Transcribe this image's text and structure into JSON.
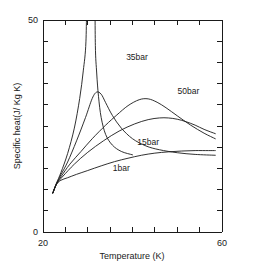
{
  "chart_data": {
    "type": "line",
    "title": "",
    "xlabel": "Temperature (K)",
    "ylabel": "Specific heat(J/ Kg K)",
    "xlim": [
      20,
      60
    ],
    "ylim": [
      0,
      50
    ],
    "xticks": [
      20,
      60
    ],
    "xtick_labels": [
      "20",
      "60"
    ],
    "yticks": [
      0,
      50
    ],
    "ytick_labels": [
      "0",
      "50"
    ],
    "x_minor_tick_count": 8,
    "y_minor_tick_count": 10,
    "grid": false,
    "legend_position": "inline-annotations",
    "series": [
      {
        "name": "1bar",
        "label": "1bar",
        "label_x": 37.5,
        "label_y": 14.5,
        "x": [
          22.2,
          23.0,
          24.0,
          25.5,
          27.5,
          30.0,
          33.0,
          36.0,
          39.0,
          42.0,
          45.0,
          48.0,
          51.0,
          54.0,
          57.0,
          58.5
        ],
        "y": [
          9.2,
          11.2,
          12.2,
          12.8,
          13.6,
          14.5,
          15.6,
          16.6,
          17.4,
          18.1,
          18.6,
          18.9,
          19.1,
          19.2,
          19.2,
          19.2
        ]
      },
      {
        "name": "15bar",
        "label": "15bar",
        "label_x": 43.5,
        "label_y": 20.5,
        "x": [
          22.2,
          23.0,
          24.0,
          25.5,
          27.5,
          29.5,
          31.0,
          32.0,
          33.0,
          34.0,
          35.5,
          37.5,
          40.0,
          43.0,
          46.0,
          50.0,
          54.0,
          58.5
        ],
        "y": [
          9.2,
          11.3,
          13.5,
          16.5,
          21.5,
          27.0,
          31.5,
          33.0,
          32.5,
          30.5,
          27.5,
          24.5,
          22.0,
          20.3,
          19.4,
          18.7,
          18.3,
          18.1
        ]
      },
      {
        "name": "35bar",
        "label": "35bar",
        "label_x": 41.0,
        "label_y": 40.5,
        "x": [
          22.2,
          23.0,
          24.0,
          26.0,
          28.5,
          31.0,
          34.0,
          36.5,
          39.0,
          41.5,
          43.5,
          45.5,
          47.5,
          50.0,
          53.0,
          56.0,
          58.5
        ],
        "y": [
          9.2,
          11.3,
          13.0,
          16.0,
          19.0,
          22.0,
          25.2,
          27.6,
          29.8,
          31.2,
          31.4,
          30.6,
          29.3,
          27.4,
          25.2,
          23.3,
          22.0
        ]
      },
      {
        "name": "50bar",
        "label": "50bar",
        "label_x": 52.5,
        "label_y": 32.5,
        "x": [
          22.2,
          23.0,
          24.5,
          27.0,
          30.0,
          33.5,
          37.0,
          40.5,
          43.5,
          46.0,
          48.0,
          50.0,
          52.0,
          54.0,
          56.0,
          58.5
        ],
        "y": [
          9.2,
          11.3,
          13.2,
          16.0,
          18.8,
          21.5,
          23.8,
          25.5,
          26.5,
          26.9,
          26.9,
          26.6,
          26.0,
          25.2,
          24.2,
          23.2
        ]
      },
      {
        "name": "critical-divergence",
        "label": "",
        "label_x": null,
        "label_y": null,
        "x": [
          22.2,
          23.0,
          24.0,
          25.5,
          27.0,
          28.2,
          29.0,
          29.6,
          30.0,
          30.3,
          30.5,
          31.0,
          31.4,
          31.7,
          32.0,
          32.4,
          33.0,
          34.0,
          35.5,
          37.5,
          40.0
        ],
        "y": [
          9.2,
          11.5,
          14.0,
          18.5,
          24.5,
          31.5,
          38.0,
          45.0,
          50.0,
          50.0,
          50.0,
          50.0,
          50.0,
          44.0,
          37.5,
          32.0,
          27.0,
          23.0,
          20.5,
          19.0,
          18.2
        ]
      }
    ]
  },
  "colors": {
    "axis": "#1a1a1a",
    "curve": "#1a1a1a",
    "background": "#ffffff"
  }
}
